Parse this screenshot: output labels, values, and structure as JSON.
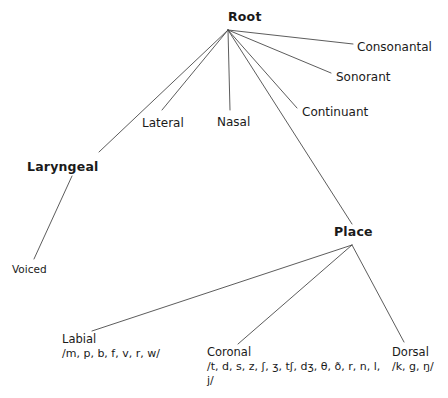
{
  "diagram": {
    "background_color": "#ffffff",
    "line_color": "#4a4a4a",
    "text_color": "#1a1a1a",
    "nodes": {
      "root": {
        "label": "Root",
        "x": 228,
        "y": 10,
        "type": "major"
      },
      "consonantal": {
        "label": "Consonantal",
        "x": 357,
        "y": 40,
        "type": "feature"
      },
      "sonorant": {
        "label": "Sonorant",
        "x": 336,
        "y": 70,
        "type": "feature"
      },
      "continuant": {
        "label": "Continuant",
        "x": 302,
        "y": 105,
        "type": "feature"
      },
      "nasal": {
        "label": "Nasal",
        "x": 217,
        "y": 115,
        "type": "feature"
      },
      "lateral": {
        "label": "Lateral",
        "x": 142,
        "y": 116,
        "type": "feature"
      },
      "laryngeal": {
        "label": "Laryngeal",
        "x": 27,
        "y": 160,
        "type": "major"
      },
      "voiced": {
        "label": "Voiced",
        "x": 12,
        "y": 263,
        "type": "terminal"
      },
      "place": {
        "label": "Place",
        "x": 334,
        "y": 225,
        "type": "major"
      },
      "labial": {
        "label": "Labial",
        "x": 62,
        "y": 333,
        "type": "place"
      },
      "coronal": {
        "label": "Coronal",
        "x": 207,
        "y": 346,
        "type": "place"
      },
      "dorsal": {
        "label": "Dorsal",
        "x": 392,
        "y": 346,
        "type": "place"
      }
    },
    "segments": {
      "labial": "/m, p, b, f, v, r, w/",
      "coronal": "/t, d, s, z, ʃ, ʒ, tʃ, dʒ, θ, ð, r, n, l, j/",
      "dorsal": "/k, g, ŋ/"
    },
    "edges": [
      {
        "name": "root-to-consonantal",
        "x1": 228,
        "y1": 30,
        "x2": 353,
        "y2": 44
      },
      {
        "name": "root-to-sonorant",
        "x1": 228,
        "y1": 30,
        "x2": 331,
        "y2": 73
      },
      {
        "name": "root-to-continuant",
        "x1": 228,
        "y1": 30,
        "x2": 297,
        "y2": 108
      },
      {
        "name": "root-to-place",
        "x1": 228,
        "y1": 30,
        "x2": 352,
        "y2": 224
      },
      {
        "name": "root-to-nasal",
        "x1": 228,
        "y1": 30,
        "x2": 230,
        "y2": 110
      },
      {
        "name": "root-to-lateral",
        "x1": 228,
        "y1": 30,
        "x2": 162,
        "y2": 110
      },
      {
        "name": "root-to-laryngeal",
        "x1": 228,
        "y1": 30,
        "x2": 99,
        "y2": 152
      },
      {
        "name": "laryngeal-to-voiced",
        "x1": 72,
        "y1": 176,
        "x2": 34,
        "y2": 259
      },
      {
        "name": "place-to-labial",
        "x1": 352,
        "y1": 245,
        "x2": 92,
        "y2": 331
      },
      {
        "name": "place-to-coronal",
        "x1": 352,
        "y1": 245,
        "x2": 238,
        "y2": 344
      },
      {
        "name": "place-to-dorsal",
        "x1": 352,
        "y1": 245,
        "x2": 404,
        "y2": 342
      }
    ]
  }
}
